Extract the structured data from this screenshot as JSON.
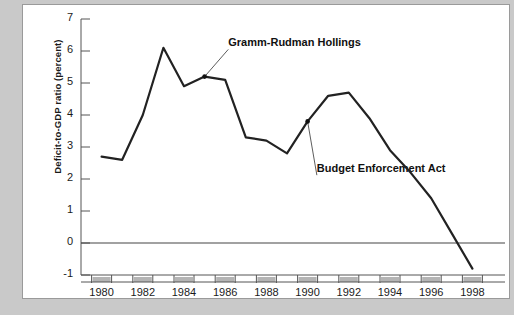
{
  "chart_data": {
    "type": "line",
    "title": "",
    "xlabel": "",
    "ylabel": "Deficit-to-GDP ratio (percent)",
    "xlim": [
      1979,
      1999
    ],
    "ylim": [
      -1,
      7
    ],
    "ytick_labels": [
      "7",
      "6",
      "5",
      "4",
      "3",
      "2",
      "1",
      "0",
      "-1"
    ],
    "ytick_values": [
      7,
      6,
      5,
      4,
      3,
      2,
      1,
      0,
      -1
    ],
    "xtick_labels": [
      "1980",
      "1982",
      "1984",
      "1986",
      "1988",
      "1990",
      "1992",
      "1994",
      "1996",
      "1998"
    ],
    "xtick_values": [
      1980,
      1982,
      1984,
      1986,
      1988,
      1990,
      1992,
      1994,
      1996,
      1998
    ],
    "grid": false,
    "legend": "none",
    "zero_line": true,
    "x": [
      1980,
      1981,
      1982,
      1983,
      1984,
      1985,
      1986,
      1987,
      1988,
      1989,
      1990,
      1991,
      1992,
      1993,
      1994,
      1995,
      1996,
      1997,
      1998
    ],
    "values": [
      2.7,
      2.6,
      4.0,
      6.1,
      4.9,
      5.2,
      5.1,
      3.3,
      3.2,
      2.8,
      3.8,
      4.6,
      4.7,
      3.9,
      2.9,
      2.2,
      1.4,
      0.3,
      -0.8
    ],
    "series": [
      {
        "name": "Deficit-to-GDP ratio",
        "color": "#222222",
        "values": [
          2.7,
          2.6,
          4.0,
          6.1,
          4.9,
          5.2,
          5.1,
          3.3,
          3.2,
          2.8,
          3.8,
          4.6,
          4.7,
          3.9,
          2.9,
          2.2,
          1.4,
          0.3,
          -0.8
        ]
      }
    ],
    "annotations": [
      {
        "text": "Gramm-Rudman Hollings",
        "point_x": 1985,
        "point_y": 5.2,
        "label_x": 1986.15,
        "label_y": 6.05,
        "marker": true
      },
      {
        "text": "Budget Enforcement Act",
        "point_x": 1990,
        "point_y": 3.8,
        "label_x": 1990.45,
        "label_y": 2.12,
        "marker": true
      }
    ]
  },
  "colors": {
    "line": "#222222",
    "axis": "#555555",
    "zero_line": "#444444",
    "panel_bg": "#ffffff",
    "figure_bg": "#c9c9c9",
    "tick_block": "#b4b4b4",
    "text": "#1a1a1a"
  }
}
